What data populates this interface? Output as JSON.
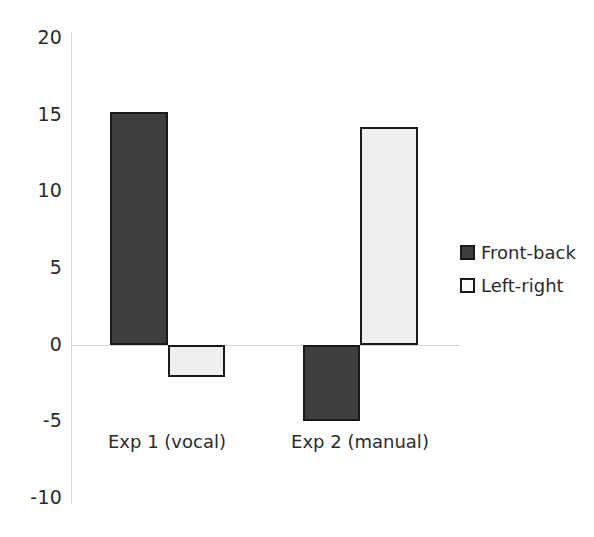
{
  "chart_data": {
    "type": "bar",
    "title": "",
    "subtitle": "",
    "xlabel": "",
    "ylabel": "",
    "categories": [
      "Exp 1 (vocal)",
      "Exp 2 (manual)"
    ],
    "series": [
      {
        "name": "Front-back",
        "values": [
          15.2,
          -5.0
        ],
        "color": "#3f3f3f"
      },
      {
        "name": "Left-right",
        "values": [
          -2.1,
          14.2
        ],
        "color": "#efefef"
      }
    ],
    "ylim": [
      -10,
      20
    ],
    "yticks": [
      20,
      15,
      10,
      5,
      0,
      -5,
      -10
    ],
    "ytick_labels": [
      "20",
      "15",
      "10",
      "5",
      "0",
      "-5",
      "-10"
    ],
    "grid": false,
    "legend_position": "right",
    "zero_line": true
  },
  "axis": {
    "y_labels": [
      {
        "text": "20",
        "value": 20
      },
      {
        "text": "15",
        "value": 15
      },
      {
        "text": "10",
        "value": 10
      },
      {
        "text": "5",
        "value": 5
      },
      {
        "text": "0",
        "value": 0
      },
      {
        "text": "-5",
        "value": -5
      },
      {
        "text": "-10",
        "value": -10
      }
    ]
  },
  "legend": {
    "items": [
      {
        "label": "Front-back",
        "swatch": "dark"
      },
      {
        "label": "Left-right",
        "swatch": "light"
      }
    ]
  },
  "colors": {
    "front_back": "#3f3f3f",
    "left_right": "#efefef",
    "bar_outline": "#1a1a1a",
    "axis": "#d9d9d9",
    "text": "#2b2b2b"
  }
}
